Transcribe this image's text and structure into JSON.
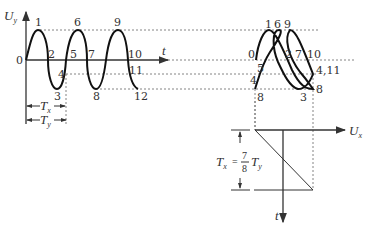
{
  "left_graph": {
    "y_axis_label": "U",
    "y_axis_sub": "y",
    "x_axis_label": "t",
    "origin_label": "0",
    "points": [
      "1",
      "2",
      "3",
      "4",
      "5",
      "6",
      "7",
      "8",
      "9",
      "10",
      "11",
      "12"
    ],
    "period_x_label": "T",
    "period_x_sub": "x",
    "period_y_label": "T",
    "period_y_sub": "y"
  },
  "right_graph": {
    "points": {
      "p0": "0",
      "p1": "1",
      "p6": "6",
      "p9": "9",
      "p2": "2",
      "p7": "7",
      "p10": "10",
      "p5": "5",
      "p4": "4",
      "p411": "4,11",
      "p8a": "8",
      "p3": "3",
      "p8b": "8"
    }
  },
  "sweep_graph": {
    "x_axis_label": "U",
    "x_axis_sub": "x",
    "t_axis_label": "t",
    "formula_lhs": "T",
    "formula_lhs_sub": "x",
    "formula_eq": "=",
    "formula_num": "7",
    "formula_den": "8",
    "formula_rhs": "T",
    "formula_rhs_sub": "y"
  }
}
